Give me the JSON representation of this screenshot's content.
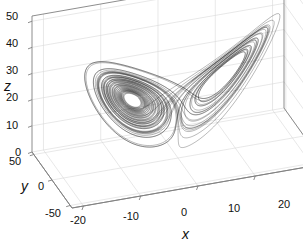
{
  "figure": {
    "type": "3d-phase-portrait",
    "background": "#ffffff",
    "curve_color": "#000000",
    "axis_color": "#808080",
    "grid_color": "#d8d8d8"
  },
  "axes": {
    "x": {
      "name": "x",
      "ticks": [
        "-20",
        "-10",
        "0",
        "10",
        "20"
      ],
      "tick_values": [
        -20,
        -10,
        0,
        10,
        20
      ],
      "limits": [
        -22,
        22
      ]
    },
    "y": {
      "name": "y",
      "ticks": [
        "50",
        "0",
        "-50"
      ],
      "tick_values": [
        50,
        0,
        -50
      ],
      "limits": [
        -55,
        55
      ]
    },
    "z": {
      "name": "z",
      "ticks": [
        "0",
        "10",
        "20",
        "30",
        "40",
        "50"
      ],
      "tick_values": [
        0,
        10,
        20,
        30,
        40,
        50
      ],
      "limits": [
        0,
        52
      ]
    }
  },
  "chart_data": {
    "type": "line",
    "title": "",
    "xlabel": "x",
    "ylabel": "y",
    "zlabel": "z",
    "xlim": [
      -22,
      22
    ],
    "ylim": [
      -55,
      55
    ],
    "zlim": [
      0,
      52
    ],
    "grid": true,
    "legend": null,
    "system": "Lorenz attractor",
    "parameters": {
      "sigma": 10,
      "rho": 28,
      "beta": 2.6667
    },
    "initial_state": [
      1,
      1,
      1
    ],
    "dt": 0.006,
    "steps": 9000,
    "fixed_points": [
      {
        "x": -8.49,
        "y": -8.49,
        "z": 27
      },
      {
        "x": 8.49,
        "y": 8.49,
        "z": 27
      }
    ]
  },
  "view": {
    "azimuth_deg": -37.5,
    "elevation_deg": 30,
    "projection": "orthographic"
  }
}
